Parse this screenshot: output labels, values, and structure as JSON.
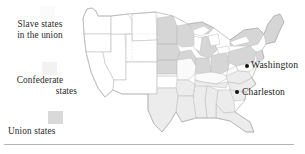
{
  "figure": {
    "kind": "historical-map"
  },
  "legend": {
    "entries": [
      {
        "id": "slave-states-in-union",
        "label": "Slave states\nin the union",
        "line1": "Slave states",
        "line2": "in the union",
        "swatch_color": "#fbfbfb"
      },
      {
        "id": "confederate-states",
        "label": "Confederate\nstates",
        "line1": "Confederate",
        "line2": "states",
        "swatch_color": "#f2f2f2"
      },
      {
        "id": "union-states",
        "label": "Union states",
        "line1": "Union states",
        "line2": "",
        "swatch_color": "#d9d9d9"
      }
    ]
  },
  "cities": [
    {
      "id": "washington",
      "name": "Washington"
    },
    {
      "id": "charleston",
      "name": "Charleston"
    }
  ],
  "map_style": {
    "border_color": "#b8b8b8",
    "fill_union": "#d6d6d6",
    "fill_confederate": "#ececec",
    "fill_border_states": "#fafafa",
    "fill_territory": "#ffffff",
    "lake_color": "#ffffff",
    "rule_color": "#b4b4b4"
  }
}
